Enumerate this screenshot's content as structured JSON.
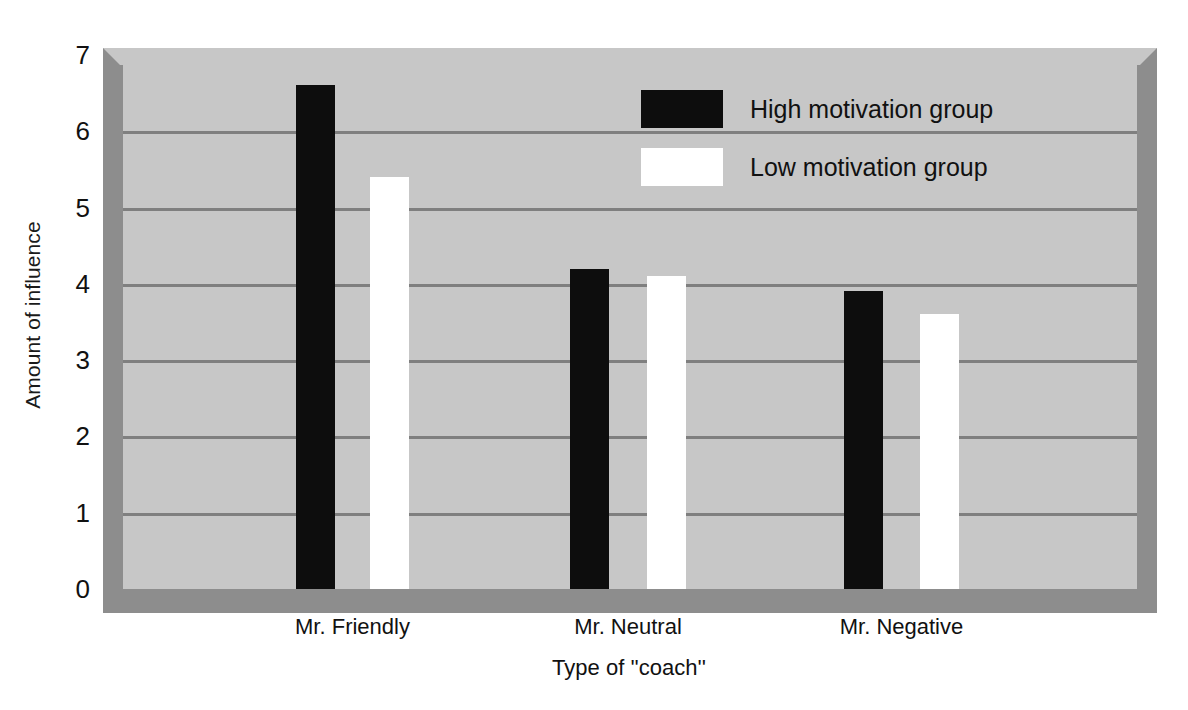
{
  "chart_data": {
    "type": "bar",
    "title": "",
    "xlabel": "Type of ''coach''",
    "ylabel": "Amount of influence",
    "categories": [
      "Mr. Friendly",
      "Mr. Neutral",
      "Mr. Negative"
    ],
    "series": [
      {
        "name": "High motivation group",
        "color": "#0d0d0d",
        "values": [
          6.6,
          4.2,
          3.9
        ]
      },
      {
        "name": "Low motivation group",
        "color": "#ffffff",
        "values": [
          5.4,
          4.1,
          3.6
        ]
      }
    ],
    "ylim": [
      0,
      7
    ],
    "yticks": [
      0,
      1,
      2,
      3,
      4,
      5,
      6,
      7
    ],
    "ytick_labels": [
      "0",
      "1",
      "2",
      "3",
      "4",
      "5",
      "6",
      "7"
    ],
    "gridlines": [
      1,
      2,
      3,
      4,
      5,
      6
    ],
    "grid": true,
    "legend_position": "upper-center",
    "plot_background": "#c7c7c7",
    "grid_color": "#7f7f7f",
    "shadow_color": "#8d8d8d"
  }
}
